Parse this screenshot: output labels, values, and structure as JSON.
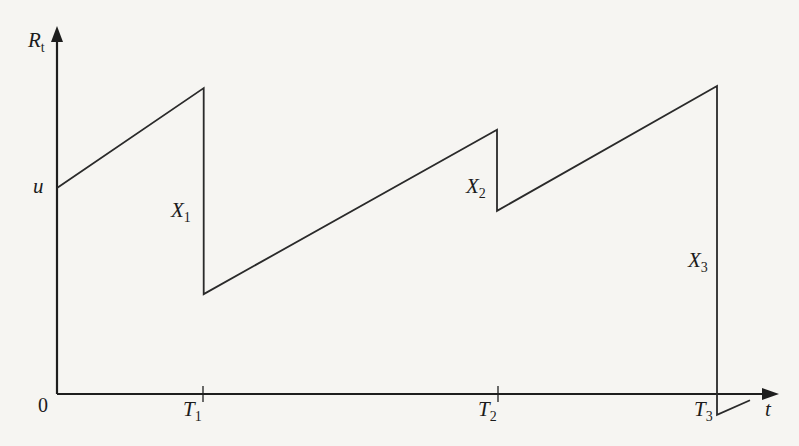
{
  "diagram": {
    "type": "surplus-process",
    "y_axis_label": {
      "main": "R",
      "sub": "t"
    },
    "x_axis_label": "t",
    "origin_label": "0",
    "initial_capital_label": "u",
    "claim_times": [
      {
        "main": "T",
        "sub": "1"
      },
      {
        "main": "T",
        "sub": "2"
      },
      {
        "main": "T",
        "sub": "3"
      }
    ],
    "claim_sizes": [
      {
        "main": "X",
        "sub": "1"
      },
      {
        "main": "X",
        "sub": "2"
      },
      {
        "main": "X",
        "sub": "3"
      }
    ],
    "path_points": [
      {
        "t": 0,
        "R": 0.99,
        "desc": "start at u"
      },
      {
        "t": 0.4,
        "R": 1.47,
        "desc": "just before T1"
      },
      {
        "t": 0.4,
        "R": 0.48,
        "desc": "after claim X1"
      },
      {
        "t": 1.2,
        "R": 1.27,
        "desc": "just before T2"
      },
      {
        "t": 1.2,
        "R": 0.88,
        "desc": "after claim X2"
      },
      {
        "t": 1.8,
        "R": 1.48,
        "desc": "just before T3"
      },
      {
        "t": 1.8,
        "R": -0.1,
        "desc": "after claim X3 (ruin)"
      },
      {
        "t": 1.89,
        "R": -0.03,
        "desc": "continuing after ruin"
      }
    ],
    "t_range": [
      0,
      2.0
    ],
    "R_range": [
      -0.15,
      1.9
    ]
  }
}
